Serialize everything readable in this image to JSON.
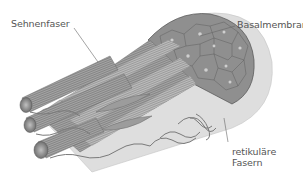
{
  "diagram": {
    "labels": {
      "tendon_fiber": "Sehnenfaser",
      "basal_membrane": "Basalmembran",
      "reticular_fibers_line1": "retikuläre",
      "reticular_fibers_line2": "Fasern"
    },
    "colors": {
      "background": "#ffffff",
      "sheath": "#dcdcdc",
      "fiber_dark": "#8a8a8a",
      "fiber_mid": "#a9a9a9",
      "fiber_light": "#c8c8c8",
      "cell_outline": "#555555",
      "label_text": "#555555",
      "leader_line": "#666666"
    }
  }
}
